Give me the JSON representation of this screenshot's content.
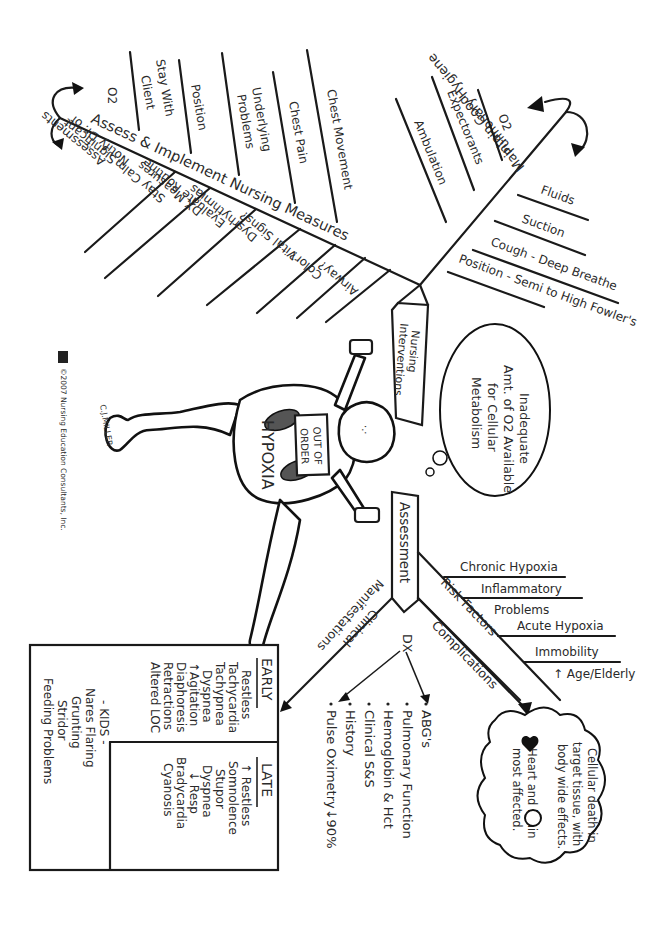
{
  "diagram": {
    "title": "HYPOXIA",
    "sign_on_body": "OUT OF ORDER",
    "artist_signature": "C.J.MILLER",
    "copyright": "©2007 Nursing Education Consultants, Inc.",
    "logo": "NEC",
    "thought_bubble": {
      "lines": [
        "Inadequate",
        "Amt. of O2 Available",
        "for Cellular",
        "Metabolism"
      ]
    },
    "nursing_interventions_sign": {
      "lines": [
        "Nursing",
        "Interventions"
      ]
    },
    "assessment_sign": "Assessment",
    "assess_implement": {
      "spine_label": "Assess & Implement Nursing Measures",
      "upper_branches": [
        "O2",
        "Stay With Client",
        "Position",
        "Underlying Problems",
        "Chest Pain",
        "Chest Movement"
      ],
      "lower_branches": [
        "Notify Dr. of Significant Assessments",
        "Stay Calm",
        "Evaluate Routine DX Measures",
        "Dysrhythmias",
        "Vital Signs?",
        "Color?",
        "Airway?"
      ]
    },
    "pulmonary_hygiene": {
      "spine_label": "Maintain Good Pulmonary Hygiene",
      "upper_branches": [
        "Ambulation",
        "Expectorants",
        "O2"
      ],
      "lower_branches": [
        "Fluids",
        "Suction",
        "Cough - Deep Breathe",
        "Position - Semi to High Fowler's"
      ]
    },
    "risk_factors": {
      "spine_label": "Risk Factors",
      "branches": [
        "Chronic Hypoxia",
        "Inflammatory Problems",
        "Acute Hypoxia",
        "Immobility",
        "↑ Age/Elderly"
      ]
    },
    "complications": {
      "spine_label": "Complications",
      "cloud_lines": [
        "Cellular death in",
        "target tissue, with",
        "body wide effects.",
        "Heart and brain",
        "most affected."
      ]
    },
    "dx": {
      "label": "DX",
      "items": [
        "ABG's",
        "Pulmonary Function",
        "Hemoglobin & Hct",
        "Clinical S&S",
        "History",
        "Pulse Oximetry↓90%"
      ]
    },
    "clinical_manifestations": {
      "label_line1": "Clinical",
      "label_line2": "Manifestations",
      "early": {
        "heading": "EARLY",
        "items": [
          "Restless",
          "Tachycardia",
          "Tachypnea",
          "Dyspnea",
          "↑Agitation",
          "Diaphoresis",
          "Retractions",
          "Altered LOC"
        ]
      },
      "late": {
        "heading": "LATE",
        "items": [
          "↑ Restless",
          "Somnolence",
          "Stupor",
          "Dyspnea",
          "↓ Resp",
          "Bradycardia",
          "Cyanosis"
        ]
      },
      "kids": {
        "heading": "- KIDS -",
        "items": [
          "Nares Flaring",
          "Grunting",
          "Stridor",
          "Feeding Problems"
        ]
      }
    }
  }
}
